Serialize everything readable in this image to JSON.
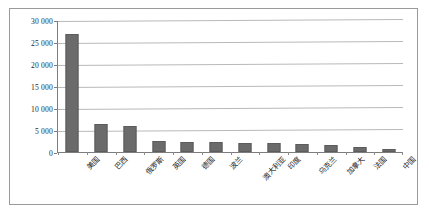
{
  "chart_data": {
    "type": "bar",
    "title": "",
    "subtitle": "",
    "xlabel": "",
    "ylabel": "",
    "categories": [
      "美国",
      "巴西",
      "俄罗斯",
      "英国",
      "德国",
      "波兰",
      "澳大利亚",
      "印度",
      "乌克兰",
      "加拿大",
      "法国",
      "中国"
    ],
    "values": [
      26900,
      6300,
      6000,
      2500,
      2300,
      2200,
      2100,
      2000,
      1800,
      1500,
      1100,
      600
    ],
    "series": [
      {
        "name": "",
        "values": [
          26900,
          6300,
          6000,
          2500,
          2300,
          2200,
          2100,
          2000,
          1800,
          1500,
          1100,
          600
        ]
      }
    ],
    "ylim": [
      0,
      30000
    ],
    "ytick_values": [
      0,
      5000,
      10000,
      15000,
      20000,
      25000,
      30000
    ],
    "ytick_labels": [
      "0",
      "5 000",
      "10 000",
      "15 000",
      "20 000",
      "25 000",
      "30 000"
    ],
    "grid": true,
    "grid_axis": "y",
    "legend": false,
    "legend_position": "none",
    "bar_color": "#6b6b6b",
    "gridline_color": "#b9b9b9",
    "axis_color": "#7d7d7d",
    "frame_color": "#9a9a9a",
    "background_color": "#ffffff"
  }
}
